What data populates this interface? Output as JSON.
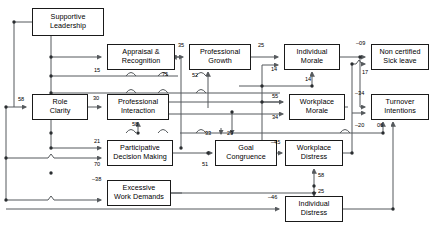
{
  "diagram": {
    "type": "path-diagram",
    "title": "",
    "nodes": [
      {
        "id": "supportive-leadership",
        "label_line1": "Supportive",
        "label_line2": "Leadership",
        "x": 32,
        "y": 8,
        "w": 72,
        "h": 28
      },
      {
        "id": "appraisal-recognition",
        "label_line1": "Appraisal &",
        "label_line2": "Recognition",
        "x": 107,
        "y": 44,
        "w": 68,
        "h": 26
      },
      {
        "id": "professional-growth",
        "label_line1": "Professional",
        "label_line2": "Growth",
        "x": 189,
        "y": 44,
        "w": 62,
        "h": 26
      },
      {
        "id": "individual-morale",
        "label_line1": "Individual",
        "label_line2": "Morale",
        "x": 284,
        "y": 44,
        "w": 56,
        "h": 26
      },
      {
        "id": "non-certified-sick-leave",
        "label_line1": "Non certified",
        "label_line2": "Sick leave",
        "x": 371,
        "y": 44,
        "w": 58,
        "h": 26
      },
      {
        "id": "role-clarity",
        "label_line1": "Role",
        "label_line2": "Clarity",
        "x": 32,
        "y": 94,
        "w": 56,
        "h": 26
      },
      {
        "id": "professional-interaction",
        "label_line1": "Professional",
        "label_line2": "Interaction",
        "x": 107,
        "y": 94,
        "w": 62,
        "h": 26
      },
      {
        "id": "workplace-morale",
        "label_line1": "Workplace",
        "label_line2": "Morale",
        "x": 289,
        "y": 94,
        "w": 56,
        "h": 26
      },
      {
        "id": "turnover-intentions",
        "label_line1": "Turnover",
        "label_line2": "Intentions",
        "x": 371,
        "y": 94,
        "w": 58,
        "h": 26
      },
      {
        "id": "participative-decision",
        "label_line1": "Participative",
        "label_line2": "Decision Making",
        "x": 107,
        "y": 140,
        "w": 66,
        "h": 26
      },
      {
        "id": "goal-congruence",
        "label_line1": "Goal",
        "label_line2": "Congruence",
        "x": 215,
        "y": 140,
        "w": 62,
        "h": 26
      },
      {
        "id": "workplace-distress",
        "label_line1": "Workplace",
        "label_line2": "Distress",
        "x": 285,
        "y": 140,
        "w": 58,
        "h": 26
      },
      {
        "id": "excessive-work-demands",
        "label_line1": "Excessive",
        "label_line2": "Work Demands",
        "x": 107,
        "y": 180,
        "w": 64,
        "h": 26
      },
      {
        "id": "individual-distress",
        "label_line1": "Individual",
        "label_line2": "Distress",
        "x": 285,
        "y": 196,
        "w": 58,
        "h": 26
      }
    ],
    "path_coefficients": [
      {
        "id": "coef-role-clarity-in",
        "value": "58",
        "x": 18,
        "y": 96,
        "from": "supportive-leadership",
        "to": "role-clarity"
      },
      {
        "id": "coef-appraisal-in",
        "value": "15",
        "x": 94,
        "y": 67,
        "from": "supportive-leadership",
        "to": "appraisal-recognition"
      },
      {
        "id": "coef-appraisal-right-in",
        "value": "75",
        "x": 162,
        "y": 71,
        "from": "participative-decision",
        "to": "appraisal-recognition"
      },
      {
        "id": "coef-professional-growth-in",
        "value": "35",
        "x": 178,
        "y": 42,
        "from": "appraisal-recognition",
        "to": "professional-growth"
      },
      {
        "id": "coef-professional-growth-bottom-in",
        "value": "52",
        "x": 192,
        "y": 72,
        "from": "professional-interaction",
        "to": "professional-growth"
      },
      {
        "id": "coef-individual-morale-in",
        "value": "25",
        "x": 258,
        "y": 42,
        "from": "professional-growth",
        "to": "individual-morale"
      },
      {
        "id": "coef-individual-morale-side-in",
        "value": "14",
        "x": 271,
        "y": 66,
        "from": "goal-congruence",
        "to": "individual-morale"
      },
      {
        "id": "coef-individual-morale-bottom-in",
        "value": "14",
        "x": 305,
        "y": 76,
        "from": "workplace-morale",
        "to": "individual-morale"
      },
      {
        "id": "coef-sick-leave-in",
        "value": "–09",
        "x": 356,
        "y": 40,
        "from": "individual-morale",
        "to": "non-certified-sick-leave"
      },
      {
        "id": "coef-sick-leave-second-in",
        "value": "17",
        "x": 362,
        "y": 69,
        "from": "workplace-distress",
        "to": "non-certified-sick-leave"
      },
      {
        "id": "coef-professional-interaction-in",
        "value": "30",
        "x": 93,
        "y": 95,
        "from": "role-clarity",
        "to": "professional-interaction"
      },
      {
        "id": "coef-professional-interaction-bot-in",
        "value": "58",
        "x": 132,
        "y": 121,
        "from": "participative-decision",
        "to": "professional-interaction"
      },
      {
        "id": "coef-workplace-morale-in",
        "value": "55",
        "x": 272,
        "y": 93,
        "from": "goal-congruence",
        "to": "workplace-morale"
      },
      {
        "id": "coef-workplace-morale-second-in",
        "value": "34",
        "x": 272,
        "y": 114,
        "from": "professional-interaction",
        "to": "workplace-morale"
      },
      {
        "id": "coef-turnover-in",
        "value": "–34",
        "x": 355,
        "y": 90,
        "from": "individual-morale",
        "to": "turnover-intentions"
      },
      {
        "id": "coef-turnover-bottom-in",
        "value": "–20",
        "x": 355,
        "y": 122,
        "from": "workplace-morale",
        "to": "turnover-intentions"
      },
      {
        "id": "coef-turnover-bottom-second-in",
        "value": "06",
        "x": 377,
        "y": 122,
        "from": "individual-distress",
        "to": "turnover-intentions"
      },
      {
        "id": "coef-participative-in",
        "value": "21",
        "x": 94,
        "y": 138,
        "from": "supportive-leadership",
        "to": "participative-decision"
      },
      {
        "id": "coef-participative-second-in",
        "value": "70",
        "x": 94,
        "y": 161,
        "from": "role-clarity",
        "to": "participative-decision"
      },
      {
        "id": "coef-goal-congruence-in",
        "value": "33",
        "x": 205,
        "y": 130,
        "from": "professional-interaction",
        "to": "goal-congruence"
      },
      {
        "id": "coef-goal-congruence-second-in",
        "value": "29",
        "x": 227,
        "y": 130,
        "from": "professional-interaction",
        "to": "goal-congruence"
      },
      {
        "id": "coef-goal-congruence-left-in",
        "value": "51",
        "x": 202,
        "y": 161,
        "from": "participative-decision",
        "to": "goal-congruence"
      },
      {
        "id": "coef-workplace-distress-in",
        "value": "–45",
        "x": 271,
        "y": 139,
        "from": "goal-congruence",
        "to": "workplace-distress"
      },
      {
        "id": "coef-workplace-distress-bottom-in",
        "value": "58",
        "x": 318,
        "y": 172,
        "from": "individual-distress",
        "to": "workplace-distress"
      },
      {
        "id": "coef-individual-distress-top-in",
        "value": "25",
        "x": 318,
        "y": 188,
        "from": "workplace-distress",
        "to": "individual-distress"
      },
      {
        "id": "coef-excessive-work-in",
        "value": "–38",
        "x": 92,
        "y": 176,
        "from": "role-clarity",
        "to": "excessive-work-demands"
      },
      {
        "id": "coef-individual-distress-in",
        "value": "–46",
        "x": 268,
        "y": 194,
        "from": "excessive-work-demands",
        "to": "individual-distress"
      }
    ]
  }
}
